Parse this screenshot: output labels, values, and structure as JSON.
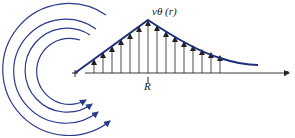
{
  "diagram": {
    "labels": {
      "velocity": "vθ (r)",
      "core_radius": "R",
      "radial_axis": "r"
    },
    "colors": {
      "curve": "#1f2f7a",
      "arcs": "#2a3a8c",
      "arrows": "#222222",
      "axis": "#222222"
    },
    "geometry": {
      "origin": [
        75,
        73
      ],
      "peak": [
        148,
        20
      ],
      "axis_end": [
        290,
        73
      ],
      "curve_end": [
        257,
        65
      ],
      "arrow_x_inner": [
        94,
        103,
        112,
        121,
        130,
        139,
        148
      ],
      "arrow_x_outer": [
        157,
        166,
        175,
        184,
        193,
        202,
        211,
        220
      ],
      "arc_count": 4
    }
  }
}
